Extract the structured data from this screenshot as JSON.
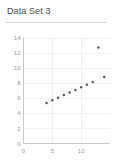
{
  "card": {
    "title": "Data Set 3"
  },
  "chart_data": {
    "type": "scatter",
    "title": "Data Set 3",
    "xlabel": "",
    "ylabel": "",
    "xlim": [
      0,
      15
    ],
    "ylim": [
      0,
      14
    ],
    "grid": true,
    "legend": false,
    "legend_position": "none",
    "x_ticks": [
      0,
      5,
      10
    ],
    "x_tick_labels": [
      "0",
      "5",
      "10"
    ],
    "y_ticks": [
      0,
      2,
      4,
      6,
      8,
      10,
      12,
      14
    ],
    "y_tick_labels": [
      "0",
      "2",
      "4",
      "6",
      "8",
      "10",
      "12",
      "14"
    ],
    "marker": "circle",
    "marker_color": "#5a5a5a",
    "series": [
      {
        "name": "Data Set 3",
        "x": [
          10,
          8,
          13,
          9,
          11,
          14,
          6,
          4,
          12,
          7,
          5
        ],
        "y": [
          7.46,
          6.77,
          12.74,
          7.11,
          7.81,
          8.84,
          6.08,
          5.39,
          8.15,
          6.42,
          5.73
        ]
      }
    ]
  }
}
